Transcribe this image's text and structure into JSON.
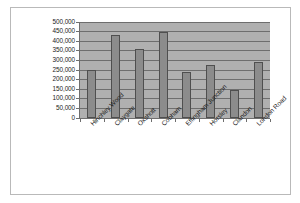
{
  "chart_data": {
    "type": "bar",
    "title": "",
    "subtitle": "",
    "xlabel": "",
    "ylabel": "",
    "categories": [
      "Hinchley Wood",
      "Claygate",
      "Oxshott",
      "Cobham",
      "Effingham Junction",
      "Horsley",
      "Clandon",
      "London Road"
    ],
    "values": [
      252000,
      430000,
      357000,
      450000,
      238000,
      278000,
      145000,
      292000
    ],
    "ylim": [
      0,
      500000
    ],
    "ytick_values": [
      0,
      50000,
      100000,
      150000,
      200000,
      250000,
      300000,
      350000,
      400000,
      450000,
      500000
    ],
    "ytick_labels": [
      "0",
      "50,000",
      "100,000",
      "150,000",
      "200,000",
      "250,000",
      "300,000",
      "350,000",
      "400,000",
      "450,000",
      "500,000"
    ],
    "grid": true,
    "legend": false,
    "legend_position": "none",
    "series": [
      {
        "name": "",
        "values": [
          252000,
          430000,
          357000,
          450000,
          238000,
          278000,
          145000,
          292000
        ]
      }
    ]
  },
  "style": {
    "bar_fill": "#8c8c8c",
    "bar_border": "#4f4f4f",
    "plot_background": "#b0b0b0",
    "gridline_color": "#6e6e6e",
    "axis_color": "#6e6e6e",
    "frame_border": "#b9b9b9",
    "page_background": "#ffffff",
    "text_color": "#1a1a1a"
  }
}
